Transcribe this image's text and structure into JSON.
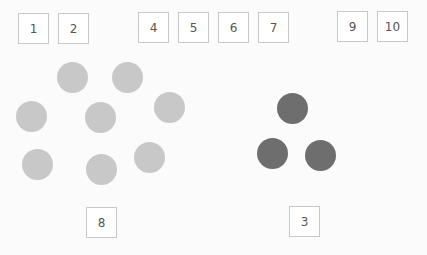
{
  "colors": {
    "background": "#fbfbfb",
    "box_border": "#c8c8c8",
    "label_text": "#555555",
    "light_circle": "#c8c8c8",
    "dark_circle": "#6e6e6e"
  },
  "boxes": [
    {
      "label": "1",
      "x": 18,
      "y": 13
    },
    {
      "label": "2",
      "x": 58,
      "y": 13
    },
    {
      "label": "4",
      "x": 138,
      "y": 12
    },
    {
      "label": "5",
      "x": 178,
      "y": 12
    },
    {
      "label": "6",
      "x": 218,
      "y": 12
    },
    {
      "label": "7",
      "x": 258,
      "y": 12
    },
    {
      "label": "9",
      "x": 337,
      "y": 11
    },
    {
      "label": "10",
      "x": 377,
      "y": 11
    },
    {
      "label": "8",
      "x": 86,
      "y": 207
    },
    {
      "label": "3",
      "x": 289,
      "y": 206
    }
  ],
  "light_circle_group": {
    "count": 8,
    "centers": [
      [
        72,
        77
      ],
      [
        127,
        77
      ],
      [
        31,
        116
      ],
      [
        100,
        117
      ],
      [
        169,
        107
      ],
      [
        37,
        164
      ],
      [
        101,
        169
      ],
      [
        149,
        157
      ]
    ]
  },
  "dark_circle_group": {
    "count": 3,
    "centers": [
      [
        292,
        108
      ],
      [
        272,
        153
      ],
      [
        320,
        155
      ]
    ]
  }
}
